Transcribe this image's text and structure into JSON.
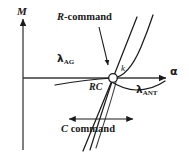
{
  "figure": {
    "type": "schematic-diagram",
    "background_color": "#ffffff",
    "stroke_color": "#1a1a1a",
    "width": 189,
    "height": 156
  },
  "axes": {
    "y_axis": {
      "name": "vertical-axis",
      "label": "M",
      "style": "italic",
      "arrow": "up",
      "x": 23,
      "top": 18,
      "bottom": 150
    },
    "x_axis": {
      "name": "horizontal-axis",
      "label": "α",
      "style": "upright",
      "arrow": "right",
      "y": 78,
      "left": 23,
      "right": 166
    }
  },
  "labels": {
    "r_command": {
      "text": "R-command",
      "italic_part": "R",
      "rest": "-command"
    },
    "c_command": {
      "text": "C command",
      "italic_part": "C",
      "rest": " command"
    },
    "lambda_ag": {
      "glyph": "λ",
      "subscript": "AG",
      "text": "λAG"
    },
    "lambda_ant": {
      "glyph": "λ",
      "subscript": "ANT",
      "text": "λANT"
    },
    "rc_point": {
      "text": "RC"
    },
    "k_slope": {
      "text": "k"
    }
  },
  "markers": {
    "rc_circle": {
      "name": "rc-intersection-circle",
      "cx": 113,
      "cy": 78,
      "r": 4.2,
      "fill": "#ffffff",
      "stroke": "#1a1a1a"
    }
  },
  "annotations": {
    "c_command_span_arrow": {
      "name": "c-command-double-arrow",
      "y": 119,
      "x_start": 67,
      "x_end": 135,
      "heads": "both"
    },
    "r_command_leader": {
      "name": "r-command-leader-arrow",
      "from": [
        100,
        28
      ],
      "to": [
        110,
        69
      ],
      "heads": "end"
    }
  },
  "curves": [
    {
      "name": "lambda-ag-curve",
      "description": "Shallow curve entering from lower-left, crossing x-axis left of RC, rising steeply to upper right",
      "path": "M 57,84 C 80,80 100,79 113,78 C 126,77 138,60 152,22"
    },
    {
      "name": "lambda-ant-curve",
      "description": "Curve from below-left of RC sweeping down and right, flattening toward the x-axis on the right",
      "path": "M 113,78 C 122,82 130,87 142,89 C 152,90 158,88 164,85"
    },
    {
      "name": "r-command-line",
      "description": "Steep straight line through RC from lower-left to upper-right",
      "path": "M 84,150 L 113,78 L 142,6"
    },
    {
      "name": "lower-left-branch",
      "description": "Curve descending from RC toward lower left region",
      "path": "M 113,78 C 108,92 98,118 88,147"
    },
    {
      "name": "lower-right-branch",
      "description": "Curve from lower-left rising through RC region to the right and up",
      "path": "M 92,148 C 100,120 108,95 113,79"
    }
  ],
  "colors": {
    "ink": "#1a1a1a",
    "background": "#ffffff",
    "axis": "#3a3a3a"
  }
}
